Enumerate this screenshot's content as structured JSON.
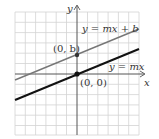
{
  "diagram": {
    "title": "",
    "grid": {
      "x_min": 15,
      "x_max": 139,
      "y_min": 12,
      "y_max": 135,
      "spacing": 10.3,
      "color": "#cfcfcf"
    },
    "axes": {
      "origin_px": [
        77,
        74
      ],
      "x_label": "x",
      "y_label": "y",
      "color": "#555555"
    },
    "lines": [
      {
        "name": "y = mx + b",
        "label": "y = mx + b",
        "from": [
          15,
          80
        ],
        "to": [
          139,
          29
        ],
        "color": "#777777",
        "width": 1.4
      },
      {
        "name": "y = mx",
        "label": "y = mx",
        "from": [
          15,
          100
        ],
        "to": [
          139,
          49
        ],
        "color": "#111111",
        "width": 2
      }
    ],
    "points": [
      {
        "label": "(0, b)",
        "px": [
          77,
          55
        ]
      },
      {
        "label": "(0, 0)",
        "px": [
          77,
          74
        ]
      }
    ]
  }
}
